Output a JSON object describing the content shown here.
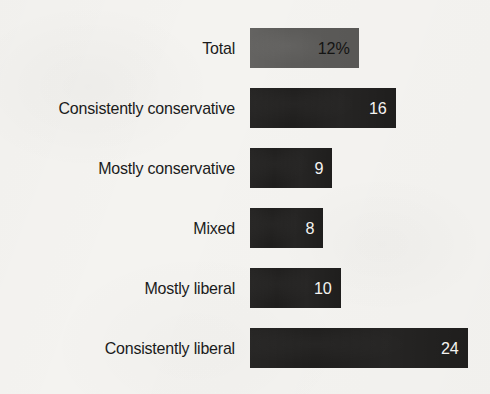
{
  "chart_data": {
    "type": "bar",
    "orientation": "horizontal",
    "title": "",
    "subtitle": "",
    "xlabel": "",
    "ylabel": "",
    "grid": false,
    "legend": null,
    "value_unit": "percent",
    "axis_visible": false,
    "xlim": [
      0,
      24
    ],
    "categories": [
      "Total",
      "Consistently conservative",
      "Mostly conservative",
      "Mixed",
      "Mostly liberal",
      "Consistently liberal"
    ],
    "values": [
      12,
      16,
      9,
      8,
      10,
      24
    ],
    "value_labels": [
      "12%",
      "16",
      "9",
      "8",
      "10",
      "24"
    ],
    "bars": [
      {
        "label": "Total",
        "value": 12,
        "value_label": "12%",
        "bar_color": "#5c5b59",
        "value_text_color": "#141413",
        "emphasis": "total"
      },
      {
        "label": "Consistently conservative",
        "value": 16,
        "value_label": "16",
        "bar_color": "#1f1e1d",
        "value_text_color": "#f6f5f3",
        "emphasis": "normal"
      },
      {
        "label": "Mostly conservative",
        "value": 9,
        "value_label": "9",
        "bar_color": "#1f1e1d",
        "value_text_color": "#f6f5f3",
        "emphasis": "normal"
      },
      {
        "label": "Mixed",
        "value": 8,
        "value_label": "8",
        "bar_color": "#1f1e1d",
        "value_text_color": "#f6f5f3",
        "emphasis": "normal"
      },
      {
        "label": "Mostly liberal",
        "value": 10,
        "value_label": "10",
        "bar_color": "#1f1e1d",
        "value_text_color": "#f6f5f3",
        "emphasis": "normal"
      },
      {
        "label": "Consistently liberal",
        "value": 24,
        "value_label": "24",
        "bar_color": "#1f1e1d",
        "value_text_color": "#f6f5f3",
        "emphasis": "normal"
      }
    ]
  },
  "colors": {
    "background": "#f4f3f0",
    "bar_dark": "#1f1e1d",
    "bar_gray": "#5c5b59",
    "label_text": "#1b1b1b",
    "value_on_dark": "#f6f5f3",
    "value_on_gray": "#141413"
  },
  "layout": {
    "bar_origin_x": 250,
    "bar_height": 40,
    "row_pitch": 60,
    "first_row_top": 28,
    "px_per_unit": 9.1,
    "label_right_edge": 235
  }
}
